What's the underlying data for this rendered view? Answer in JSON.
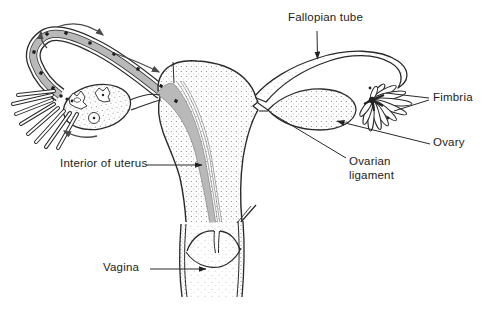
{
  "diagram": {
    "labels": {
      "fallopian_tube": "Fallopian tube",
      "fimbria": "Fimbria",
      "ovary": "Ovary",
      "ovarian_ligament": "Ovarian\nligament",
      "interior_of_uterus": "Interior of uterus",
      "vagina": "Vagina"
    },
    "colors": {
      "line": "#2a2a2a",
      "cavity_gray": "#b9b9b9",
      "arrow_gray": "#4a4a4a",
      "background": "#ffffff"
    }
  }
}
